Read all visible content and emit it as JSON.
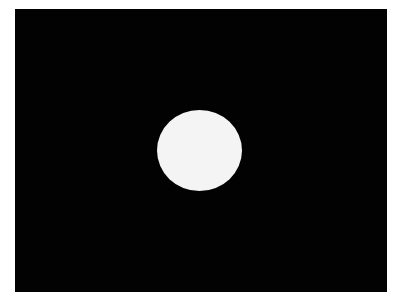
{
  "image": {
    "background_color": "#ffffff",
    "frame": {
      "color": "#020202",
      "x": 15,
      "y": 9,
      "width": 372,
      "height": 283
    },
    "disc": {
      "color": "#f4f4f4",
      "center_x": 199,
      "center_y": 150,
      "width": 85,
      "height": 81
    }
  }
}
